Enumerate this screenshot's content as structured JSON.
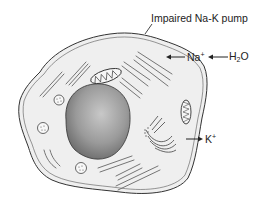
{
  "diagram": {
    "labels": {
      "pump": "Impaired Na-K pump",
      "sodium": "Na",
      "sodium_charge": "+",
      "water_base": "H",
      "water_sub": "2",
      "water_tail": "O",
      "potassium": "K",
      "potassium_charge": "+"
    },
    "arrows": [
      {
        "from": "H2O",
        "to": "Na+",
        "direction": "left"
      },
      {
        "from": "Na+",
        "to": "cell interior",
        "direction": "left"
      },
      {
        "from": "cell interior",
        "to": "K+",
        "direction": "right"
      }
    ],
    "structures": [
      "plasma-membrane",
      "cytoplasm",
      "nucleus",
      "mitochondria",
      "endoplasmic-reticulum",
      "golgi-apparatus",
      "vesicles"
    ],
    "colors": {
      "membrane": "#333333",
      "cytoplasm": "#efefef",
      "nucleus_light": "#bdbdbd",
      "nucleus_dark": "#6a6a6a",
      "organelle": "#555555"
    }
  }
}
